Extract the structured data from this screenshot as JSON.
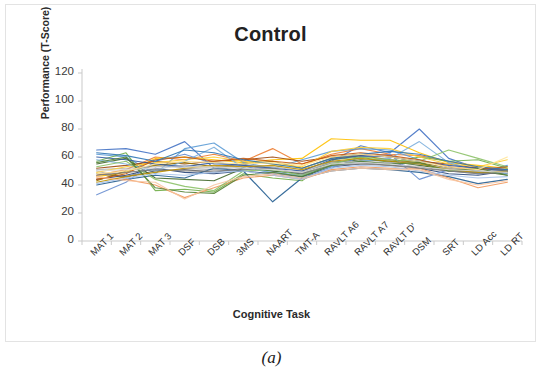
{
  "figure": {
    "caption": "(a)"
  },
  "chart_data": {
    "type": "line",
    "title": "Control",
    "xlabel": "Cognitive Task",
    "ylabel": "Performance (T-Score)",
    "ylim": [
      0,
      120
    ],
    "ytick_labels": [
      "0",
      "20",
      "40",
      "60",
      "80",
      "100",
      "120"
    ],
    "yticks": [
      0,
      20,
      40,
      60,
      80,
      100,
      120
    ],
    "grid": false,
    "legend": "none",
    "categories": [
      "MAT 1",
      "MAT 2",
      "MAT 3",
      "DSF",
      "DSB",
      "3MS",
      "NAART",
      "TMT-A",
      "RAVLT A6",
      "RAVLT A7",
      "RAVLT D'",
      "DSM",
      "SRT",
      "LD Acc",
      "LD RT"
    ],
    "palette": [
      "#4472C4",
      "#ED7D31",
      "#A5A5A5",
      "#FFC000",
      "#5B9BD5",
      "#70AD47",
      "#264478",
      "#9E480E",
      "#636363",
      "#997300",
      "#255E91",
      "#43682B",
      "#698ED0",
      "#F1975A",
      "#B7B7B7",
      "#FFCD33",
      "#7CAFDD",
      "#8CC168",
      "#335AA1",
      "#C55A11",
      "#7F7F7F",
      "#BF9000",
      "#2E75B6",
      "#548235",
      "#A9C4EB",
      "#F7C6A3",
      "#D9D9D9",
      "#FFE699"
    ],
    "series": [
      {
        "name": "P01",
        "color": "#4472C4",
        "values": [
          65,
          66,
          62,
          71,
          52,
          55,
          50,
          48,
          57,
          68,
          63,
          80,
          59,
          52,
          50
        ]
      },
      {
        "name": "P02",
        "color": "#ED7D31",
        "values": [
          47,
          51,
          60,
          58,
          62,
          57,
          66,
          55,
          62,
          66,
          62,
          61,
          57,
          53,
          51
        ]
      },
      {
        "name": "P03",
        "color": "#A5A5A5",
        "values": [
          50,
          45,
          55,
          52,
          51,
          53,
          52,
          47,
          57,
          57,
          58,
          55,
          50,
          48,
          49
        ]
      },
      {
        "name": "P04",
        "color": "#FFC000",
        "values": [
          46,
          49,
          59,
          60,
          58,
          56,
          58,
          59,
          73,
          72,
          72,
          63,
          56,
          54,
          52
        ]
      },
      {
        "name": "P05",
        "color": "#5B9BD5",
        "values": [
          62,
          60,
          48,
          66,
          70,
          56,
          52,
          58,
          64,
          66,
          65,
          58,
          53,
          48,
          54
        ]
      },
      {
        "name": "P06",
        "color": "#70AD47",
        "values": [
          57,
          63,
          36,
          37,
          35,
          48,
          45,
          43,
          58,
          60,
          56,
          60,
          57,
          58,
          52
        ]
      },
      {
        "name": "P07",
        "color": "#264478",
        "values": [
          44,
          47,
          52,
          49,
          48,
          50,
          48,
          46,
          53,
          55,
          56,
          52,
          48,
          47,
          50
        ]
      },
      {
        "name": "P08",
        "color": "#9E480E",
        "values": [
          52,
          54,
          57,
          55,
          57,
          58,
          60,
          57,
          60,
          62,
          60,
          57,
          55,
          52,
          51
        ]
      },
      {
        "name": "P09",
        "color": "#636363",
        "values": [
          48,
          46,
          50,
          51,
          49,
          52,
          50,
          49,
          55,
          56,
          54,
          53,
          50,
          49,
          48
        ]
      },
      {
        "name": "P10",
        "color": "#997300",
        "values": [
          43,
          50,
          54,
          56,
          53,
          55,
          57,
          52,
          59,
          61,
          58,
          56,
          52,
          50,
          49
        ]
      },
      {
        "name": "P11",
        "color": "#255E91",
        "values": [
          40,
          44,
          47,
          45,
          52,
          50,
          28,
          45,
          50,
          52,
          51,
          49,
          46,
          41,
          44
        ]
      },
      {
        "name": "P12",
        "color": "#43682B",
        "values": [
          55,
          59,
          45,
          44,
          43,
          52,
          50,
          48,
          56,
          58,
          57,
          54,
          51,
          50,
          47
        ]
      },
      {
        "name": "P13",
        "color": "#698ED0",
        "values": [
          33,
          42,
          57,
          62,
          55,
          54,
          48,
          45,
          52,
          60,
          62,
          44,
          51,
          49,
          51
        ]
      },
      {
        "name": "P14",
        "color": "#F1975A",
        "values": [
          45,
          44,
          40,
          31,
          38,
          45,
          47,
          44,
          51,
          53,
          52,
          52,
          45,
          38,
          42
        ]
      },
      {
        "name": "P15",
        "color": "#B7B7B7",
        "values": [
          51,
          52,
          53,
          54,
          52,
          54,
          53,
          50,
          56,
          57,
          56,
          55,
          52,
          51,
          50
        ]
      },
      {
        "name": "P16",
        "color": "#FFCD33",
        "values": [
          49,
          53,
          56,
          58,
          60,
          57,
          55,
          53,
          64,
          67,
          66,
          60,
          55,
          53,
          58
        ]
      },
      {
        "name": "P17",
        "color": "#7CAFDD",
        "values": [
          58,
          55,
          50,
          57,
          67,
          52,
          49,
          47,
          53,
          57,
          59,
          71,
          56,
          50,
          48
        ]
      },
      {
        "name": "P18",
        "color": "#8CC168",
        "values": [
          53,
          57,
          44,
          39,
          36,
          50,
          51,
          47,
          55,
          60,
          58,
          57,
          65,
          59,
          53
        ]
      },
      {
        "name": "P19",
        "color": "#335AA1",
        "values": [
          60,
          58,
          55,
          53,
          56,
          54,
          52,
          50,
          58,
          61,
          60,
          57,
          54,
          52,
          50
        ]
      },
      {
        "name": "P20",
        "color": "#C55A11",
        "values": [
          44,
          48,
          58,
          60,
          57,
          59,
          57,
          55,
          61,
          63,
          61,
          58,
          53,
          51,
          53
        ]
      },
      {
        "name": "P21",
        "color": "#7F7F7F",
        "values": [
          47,
          49,
          51,
          50,
          50,
          51,
          52,
          48,
          54,
          55,
          54,
          52,
          50,
          48,
          49
        ]
      },
      {
        "name": "P22",
        "color": "#BF9000",
        "values": [
          42,
          46,
          49,
          52,
          54,
          53,
          54,
          51,
          57,
          59,
          57,
          55,
          51,
          49,
          50
        ]
      },
      {
        "name": "P23",
        "color": "#2E75B6",
        "values": [
          63,
          61,
          57,
          65,
          63,
          58,
          55,
          52,
          59,
          62,
          64,
          62,
          57,
          53,
          51
        ]
      },
      {
        "name": "P24",
        "color": "#548235",
        "values": [
          56,
          60,
          38,
          35,
          34,
          47,
          49,
          46,
          54,
          57,
          55,
          56,
          50,
          52,
          47
        ]
      },
      {
        "name": "P25",
        "color": "#A9C4EB",
        "values": [
          41,
          45,
          48,
          47,
          49,
          50,
          47,
          44,
          52,
          54,
          53,
          50,
          47,
          45,
          46
        ]
      },
      {
        "name": "P26",
        "color": "#F7C6A3",
        "values": [
          46,
          43,
          42,
          30,
          40,
          46,
          48,
          45,
          50,
          52,
          51,
          51,
          44,
          40,
          43
        ]
      },
      {
        "name": "P27",
        "color": "#D9D9D9",
        "values": [
          50,
          51,
          52,
          53,
          53,
          52,
          51,
          49,
          55,
          56,
          55,
          53,
          51,
          50,
          49
        ]
      },
      {
        "name": "P28",
        "color": "#FFE699",
        "values": [
          48,
          50,
          55,
          57,
          56,
          55,
          56,
          54,
          60,
          62,
          60,
          57,
          53,
          51,
          60
        ]
      }
    ]
  }
}
